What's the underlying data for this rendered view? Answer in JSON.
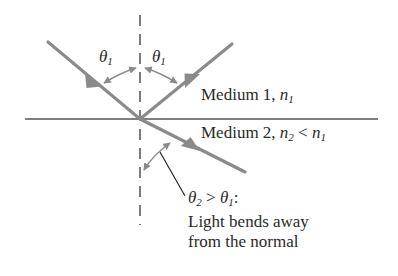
{
  "figure": {
    "name": "refraction-diagram"
  },
  "colors": {
    "ray": "#8a8a8a",
    "arc": "#8a8a8a",
    "interface_line": "#555555",
    "normal_dash": "#6e6e6e",
    "leader_line": "#1a1a1a",
    "text": "#2a2a2a",
    "background": "#ffffff"
  },
  "angles": {
    "incident_label": {
      "symbol": "θ",
      "subscript": "1"
    },
    "reflected_label": {
      "symbol": "θ",
      "subscript": "1"
    }
  },
  "media": {
    "upper": {
      "name": "Medium 1,",
      "index_symbol": "n",
      "index_subscript": "1"
    },
    "lower": {
      "name": "Medium 2,",
      "index_symbol": "n",
      "index_subscript_first": "2",
      "comparison": "<",
      "index_symbol_second": "n",
      "index_subscript_second": "1"
    }
  },
  "caption": {
    "line1": {
      "symbol_a": "θ",
      "sub_a": "2",
      "operator": ">",
      "symbol_b": "θ",
      "sub_b": "1",
      "colon": ":"
    },
    "line2": "Light bends away",
    "line3": "from the normal"
  },
  "geometry": {
    "origin": {
      "x": 140,
      "y": 119
    },
    "interface": {
      "x1": 25,
      "y1": 119,
      "x2": 378,
      "y2": 119
    },
    "normal": {
      "x": 140,
      "y_top": 15,
      "y_bottom": 225
    },
    "incident_ray": {
      "x1": 48,
      "y1": 42,
      "x2": 140,
      "y2": 119
    },
    "reflected_ray": {
      "x1": 140,
      "y1": 119,
      "x2": 232,
      "y2": 44
    },
    "refracted_ray": {
      "x1": 140,
      "y1": 119,
      "x2": 245,
      "y2": 172
    },
    "leader_line": {
      "x1": 185,
      "y1": 196,
      "x2": 160,
      "y2": 152
    }
  }
}
